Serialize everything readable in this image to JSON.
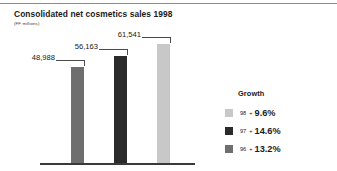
{
  "header": {
    "title": "Consolidated net cosmetics sales 1998",
    "subtitle": "(FF millions)"
  },
  "legend": {
    "title": "Growth",
    "rows": [
      {
        "year": "98",
        "plus": "+",
        "pct": "9.6%",
        "color": "#c8c8c8",
        "swatch_name": "legend-swatch-98"
      },
      {
        "year": "97",
        "plus": "+",
        "pct": "14.6%",
        "color": "#2b2b2b",
        "swatch_name": "legend-swatch-97"
      },
      {
        "year": "96",
        "plus": "+",
        "pct": "13.2%",
        "color": "#6e6e6e",
        "swatch_name": "legend-swatch-96"
      }
    ]
  },
  "chart_data": {
    "type": "bar",
    "title": "Consolidated net cosmetics sales 1998",
    "subtitle": "(FF millions)",
    "xlabel": "",
    "ylabel": "FF millions",
    "categories": [
      "1996",
      "1997",
      "1998"
    ],
    "values": [
      48988,
      56163,
      61541
    ],
    "value_labels": [
      "48,988",
      "56,163",
      "61,541"
    ],
    "colors": [
      "#6e6e6e",
      "#2b2b2b",
      "#c8c8c8"
    ],
    "ylim": [
      0,
      61541
    ],
    "grid": false,
    "legend_position": "right",
    "series": [
      {
        "name": "Net cosmetics sales",
        "values": [
          48988,
          56163,
          61541
        ]
      }
    ],
    "annotations": [
      {
        "label": "98 + 9.6%",
        "year": "98",
        "growth_pct": 9.6
      },
      {
        "label": "97 + 14.6%",
        "year": "97",
        "growth_pct": 14.6
      },
      {
        "label": "96 + 13.2%",
        "year": "96",
        "growth_pct": 13.2
      }
    ]
  }
}
